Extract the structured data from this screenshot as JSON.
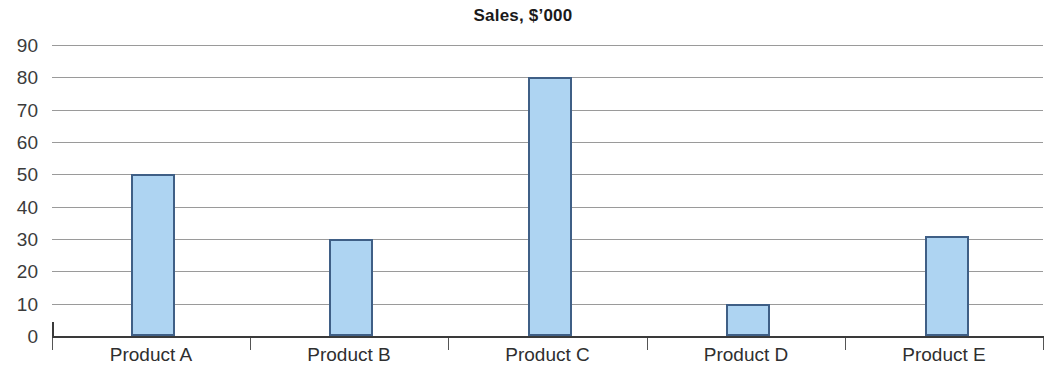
{
  "chart_data": {
    "type": "bar",
    "title": "Sales, $’000",
    "xlabel": "",
    "ylabel": "",
    "categories": [
      "Product A",
      "Product B",
      "Product C",
      "Product D",
      "Product E"
    ],
    "values": [
      50,
      30,
      80,
      10,
      31
    ],
    "series": [
      {
        "name": "Sales",
        "values": [
          50,
          30,
          80,
          10,
          31
        ]
      }
    ],
    "ylim": [
      0,
      90
    ],
    "ytick_labels": [
      "90",
      "80",
      "70",
      "60",
      "50",
      "40",
      "30",
      "20",
      "10",
      "0"
    ],
    "ytick_values": [
      90,
      80,
      70,
      60,
      50,
      40,
      30,
      20,
      10,
      0
    ],
    "ystep": 10,
    "grid": "horizontal",
    "legend": "none",
    "bar_fill_color": "#aed4f2",
    "bar_border_color": "#3f5f86",
    "gridline_color": "#9a9a9a",
    "axis_color": "#3a3a3a",
    "text_color": "#2f2f2f",
    "background_color": "#ffffff"
  }
}
